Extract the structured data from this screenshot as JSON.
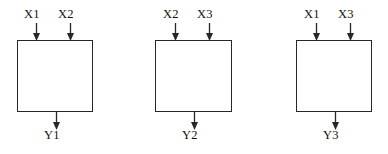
{
  "diagram": {
    "stroke_color": "#272727",
    "text_color": "#111111",
    "background_color": "#ffffff",
    "blocks": [
      {
        "id": "block-1",
        "inputs": [
          {
            "label": "X1",
            "label_x": 24,
            "label_y": 8,
            "arrow_x": 36
          },
          {
            "label": "X2",
            "label_x": 58,
            "label_y": 8,
            "arrow_x": 70
          }
        ],
        "output": {
          "label": "Y1",
          "label_x": 44,
          "label_y": 129,
          "arrow_x": 56
        },
        "box": {
          "x": 17,
          "y": 40,
          "w": 76,
          "h": 72
        }
      },
      {
        "id": "block-2",
        "inputs": [
          {
            "label": "X2",
            "label_x": 163,
            "label_y": 8,
            "arrow_x": 175
          },
          {
            "label": "X3",
            "label_x": 197,
            "label_y": 8,
            "arrow_x": 209
          }
        ],
        "output": {
          "label": "Y2",
          "label_x": 182,
          "label_y": 129,
          "arrow_x": 194
        },
        "box": {
          "x": 155,
          "y": 40,
          "w": 77,
          "h": 72
        }
      },
      {
        "id": "block-3",
        "inputs": [
          {
            "label": "X1",
            "label_x": 304,
            "label_y": 8,
            "arrow_x": 316
          },
          {
            "label": "X3",
            "label_x": 338,
            "label_y": 8,
            "arrow_x": 350
          }
        ],
        "output": {
          "label": "Y3",
          "label_x": 323,
          "label_y": 129,
          "arrow_x": 335
        },
        "box": {
          "x": 296,
          "y": 40,
          "w": 76,
          "h": 72
        }
      }
    ]
  }
}
